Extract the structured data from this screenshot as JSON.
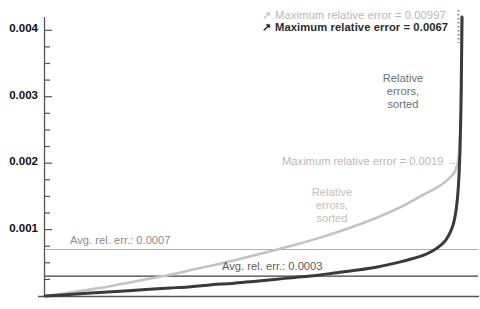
{
  "chart_data": {
    "type": "line",
    "title": "",
    "xlabel": "",
    "ylabel": "",
    "xlim": [
      0,
      1
    ],
    "ylim": [
      0,
      0.0042
    ],
    "grid": false,
    "legend_position": "top-right",
    "yticks": [
      0.001,
      0.002,
      0.003,
      0.004
    ],
    "ytick_labels": [
      "0.001",
      "0.002",
      "0.003",
      "0.004"
    ],
    "ytick_minor_step": 0.00025,
    "series": [
      {
        "name": "Relative errors, sorted (light)",
        "color": "#c3c3c3",
        "description": "Sorted relative errors, light gray curve",
        "maximum_relative_error": 0.00997,
        "average_relative_error": 0.0007,
        "x": [
          0.0,
          0.05,
          0.1,
          0.15,
          0.2,
          0.25,
          0.3,
          0.35,
          0.4,
          0.45,
          0.5,
          0.55,
          0.6,
          0.65,
          0.7,
          0.75,
          0.8,
          0.85,
          0.9,
          0.94,
          0.96,
          0.975,
          0.985,
          0.992,
          0.996,
          0.999,
          1.0
        ],
        "y": [
          0.0,
          4e-05,
          9e-05,
          0.00014,
          0.0002,
          0.00026,
          0.00032,
          0.00039,
          0.00046,
          0.00053,
          0.00061,
          0.00069,
          0.00077,
          0.00086,
          0.00096,
          0.00107,
          0.00119,
          0.00133,
          0.0015,
          0.00163,
          0.00172,
          0.00181,
          0.0019,
          0.0021,
          0.0025,
          0.0033,
          0.0042
        ]
      },
      {
        "name": "Relative errors, sorted (dark)",
        "color": "#3a3a3a",
        "description": "Sorted relative errors, dark gray curve",
        "maximum_relative_error": 0.0067,
        "average_relative_error": 0.0003,
        "x": [
          0.0,
          0.05,
          0.1,
          0.15,
          0.2,
          0.25,
          0.3,
          0.35,
          0.4,
          0.45,
          0.5,
          0.55,
          0.6,
          0.65,
          0.7,
          0.75,
          0.8,
          0.85,
          0.88,
          0.91,
          0.93,
          0.95,
          0.962,
          0.972,
          0.98,
          0.986,
          0.991,
          0.995,
          0.9975,
          0.999,
          1.0
        ],
        "y": [
          0.0,
          2e-05,
          4e-05,
          6e-05,
          8e-05,
          0.0001,
          0.00012,
          0.00014,
          0.00017,
          0.00019,
          0.00022,
          0.00025,
          0.00028,
          0.00031,
          0.00035,
          0.00039,
          0.00044,
          0.00051,
          0.00056,
          0.00062,
          0.00068,
          0.00077,
          0.00085,
          0.00096,
          0.0011,
          0.0013,
          0.00162,
          0.00215,
          0.00285,
          0.0036,
          0.0042
        ]
      }
    ],
    "reference_lines": [
      {
        "name": "Avg. rel. err. light",
        "value": 0.0007,
        "label": "Avg. rel. err.: 0.0007",
        "color": "#adadad",
        "orientation": "horizontal"
      },
      {
        "name": "Avg. rel. err. dark",
        "value": 0.0003,
        "label": "Avg. rel. err.: 0.0003",
        "color": "#3f3f3f",
        "orientation": "horizontal"
      }
    ],
    "annotations": [
      {
        "name": "max-light-legend",
        "text": "Maximum relative  error = 0.00997",
        "arrow": "↗",
        "color": "#b7b7b7"
      },
      {
        "name": "max-dark-legend",
        "text": "Maximum relative  error = 0.0067",
        "arrow": "↗",
        "color": "#2b2b2b"
      },
      {
        "name": "max-light-inline",
        "text": "Maximum relative error = 0.0019 →",
        "color": "#b9b9b9"
      },
      {
        "name": "curve-label-dark",
        "text": "Relative errors, sorted",
        "color": "#6f6f6f"
      },
      {
        "name": "curve-label-light",
        "text": "Relative errors, sorted",
        "color": "#c0c0c0"
      }
    ]
  },
  "axis": {
    "ytick_labels": [
      "0.004",
      "0.003",
      "0.002",
      "0.001"
    ]
  },
  "legend": {
    "rows": [
      {
        "arrow": "↗",
        "text": "Maximum relative  error = 0.00997"
      },
      {
        "arrow": "↗",
        "text": "Maximum relative  error = 0.0067"
      }
    ]
  },
  "callouts": {
    "dark_curve_label_line1": "Relative",
    "dark_curve_label_line2": "errors,",
    "dark_curve_label_line3": "sorted",
    "light_curve_label_line1": "Relative",
    "light_curve_label_line2": "errors,",
    "light_curve_label_line3": "sorted",
    "max_light_inline": "Maximum relative error = 0.0019 →",
    "avg_light": "Avg. rel. err.: 0.0007",
    "avg_dark": "Avg. rel. err.: 0.0003"
  }
}
